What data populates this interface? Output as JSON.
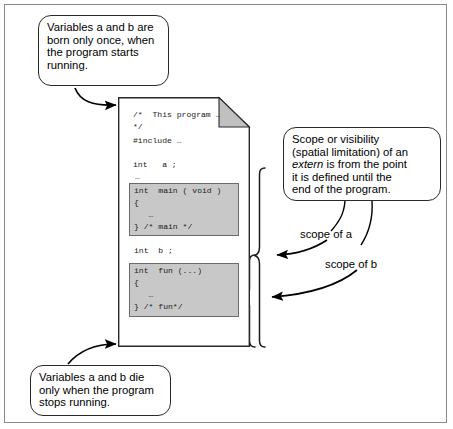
{
  "figure": {
    "colors": {
      "code_block_fill": "#c8c8c8",
      "code_block_border": "#6a6a6a",
      "outline": "#2a2a2a",
      "frame": "#8a8a8a",
      "fold_fill": "#c0c0c0",
      "background": "#ffffff"
    }
  },
  "callouts": {
    "top": {
      "lines": [
        "Variables a and b are",
        "born only once, when",
        "the program starts",
        "running."
      ]
    },
    "right": {
      "lines": [
        "Scope or visibility",
        "(spatial limitation) of an",
        "it is defined until the",
        "end of the program."
      ],
      "emphasis_line": {
        "italic": "extern",
        "rest": " is from the point"
      }
    },
    "bottom": {
      "lines": [
        "Variables a and b die",
        "only when the program",
        "stops running."
      ]
    }
  },
  "document": {
    "code_lines": [
      "/*  This program …",
      "*/",
      "#include …",
      "int   a ;",
      "…",
      "int  b ;"
    ],
    "main_block": [
      "int  main ( void )",
      "{",
      "   …",
      "} /* main */"
    ],
    "fun_block": [
      "int  fun (...)",
      "{",
      "   …",
      "} /* fun*/"
    ]
  },
  "annotations": {
    "scope_a": "scope of a",
    "scope_b": "scope of b"
  }
}
